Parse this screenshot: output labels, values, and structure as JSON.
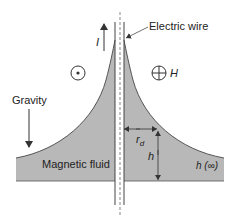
{
  "diagram": {
    "labels": {
      "wire": "Electric wire",
      "current": "I",
      "field": "H",
      "gravity": "Gravity",
      "fluid": "Magnetic fluid",
      "radius": "r",
      "radius_sub": "d",
      "height": "h",
      "height_far": "h (∞)"
    },
    "symbols": {
      "field_out": "circle-dot-icon",
      "field_in": "circle-cross-icon"
    },
    "colors": {
      "fluid": "#b8b8b8",
      "line": "#333333",
      "text": "#222222"
    }
  }
}
